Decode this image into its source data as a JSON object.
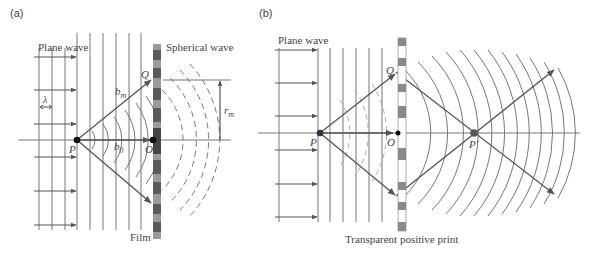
{
  "panels": {
    "a": {
      "tag": "(a)",
      "labels": {
        "plane_wave": "Plane wave",
        "spherical_wave": "Spherical wave",
        "lambda": "λ",
        "Q": "Q",
        "P": "P",
        "O": "O",
        "bm": "b",
        "bm_sub": "m",
        "b0": "b",
        "b0_sub": "0",
        "rm": "r",
        "rm_sub": "m",
        "film": "Film"
      }
    },
    "b": {
      "tag": "(b)",
      "labels": {
        "plane_wave": "Plane wave",
        "Q": "Q",
        "P": "P",
        "O": "O",
        "P_prime": "P′",
        "print": "Transparent positive print"
      }
    }
  },
  "colors": {
    "line": "#6e6e6e",
    "arrow": "#555555",
    "film_dark": "#5a5a5a",
    "film_light": "#9a9a9a",
    "dot": "#111111"
  }
}
